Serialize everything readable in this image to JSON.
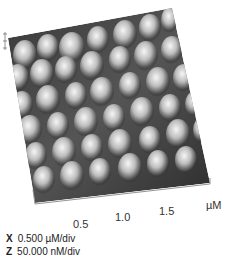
{
  "figure": {
    "type": "3D AFM surface topography",
    "x_axis": {
      "ticks": [
        "0.5",
        "1.0",
        "1.5"
      ],
      "unit": "µM"
    },
    "legend": {
      "x": {
        "axis": "X",
        "value": "0.500 µM/div"
      },
      "z": {
        "axis": "Z",
        "value": "50.000 nM/div"
      }
    }
  }
}
